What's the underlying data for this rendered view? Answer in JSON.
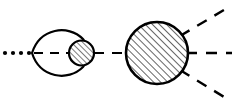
{
  "figure": {
    "kind": "feynman-like-diagram",
    "title": "",
    "caption": "",
    "width": 232,
    "height": 109,
    "background_color": "#ffffff",
    "line_color": "#000000",
    "hatch_color": "#1a1a1a",
    "axis_y": 53
  },
  "elements": {
    "incoming_dotted_line": {
      "label": "",
      "style": "dotted",
      "dot_count": 4,
      "dot_radius": 2.1,
      "dots_x": [
        5,
        13,
        21,
        29
      ],
      "y": 53
    },
    "lens_loop": {
      "label": "",
      "style": "solid",
      "shape": "vesica-lens",
      "left_vertex_x": 32,
      "right_vertex_x": 86,
      "top_y": 29,
      "bottom_y": 77,
      "stroke_width": 2.2
    },
    "lens_internal_dashed_line": {
      "label": "",
      "style": "dashed",
      "x_start": 34,
      "x_end": 72,
      "y": 53,
      "dash": "9 7"
    },
    "small_hatched_blob": {
      "label": "",
      "shape": "circle",
      "fill": "diagonal-hatch",
      "cx": 81.5,
      "cy": 53,
      "r": 12.5,
      "stroke_width": 2.2,
      "hatch_spacing": 4,
      "hatch_angle_deg": 45
    },
    "connector_dashed_line": {
      "label": "",
      "style": "dashed",
      "x_start": 95,
      "x_end": 127,
      "y": 53,
      "dash": "10 8"
    },
    "large_hatched_blob": {
      "label": "",
      "shape": "circle",
      "fill": "diagonal-hatch",
      "cx": 157,
      "cy": 53,
      "r": 31,
      "stroke_width": 2.6,
      "hatch_spacing": 5,
      "hatch_angle_deg": 45
    },
    "outgoing_lines": [
      {
        "name": "upper-right-dashed-line",
        "label": "",
        "style": "dashed",
        "x_start": 182,
        "y_start": 35,
        "x_end": 229,
        "y_end": 7,
        "dash": "11 9"
      },
      {
        "name": "horizontal-right-dashed-line",
        "label": "",
        "style": "dashed",
        "x_start": 188,
        "y_start": 53,
        "x_end": 231,
        "y_end": 53,
        "dash": "11 9"
      },
      {
        "name": "lower-right-dashed-line",
        "label": "",
        "style": "dashed",
        "x_start": 182,
        "y_start": 71,
        "x_end": 229,
        "y_end": 100,
        "dash": "11 9"
      }
    ]
  }
}
